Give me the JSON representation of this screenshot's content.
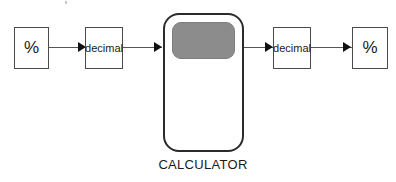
{
  "diagram": {
    "caption": "CALCULATOR",
    "colors": {
      "box_border": "#4a4a4a",
      "calculator_border": "#2b2b2b",
      "display_fill": "#8c8c8c",
      "connector": "#555555",
      "arrowhead": "#111111",
      "text": "#1a1a1a",
      "background": "#ffffff"
    },
    "nodes": [
      {
        "id": "pct-in",
        "label": "%",
        "shape": "rectangle"
      },
      {
        "id": "dec-in",
        "label": "decimal",
        "shape": "rectangle"
      },
      {
        "id": "calculator",
        "label": "CALCULATOR",
        "shape": "rounded-device"
      },
      {
        "id": "dec-out",
        "label": "decimal",
        "shape": "rectangle"
      },
      {
        "id": "pct-out",
        "label": "%",
        "shape": "rectangle"
      }
    ],
    "edges": [
      {
        "id": "edge-1",
        "from": "pct-in",
        "to": "dec-in",
        "label": ""
      },
      {
        "id": "edge-2",
        "from": "dec-in",
        "to": "calculator",
        "label": ""
      },
      {
        "id": "edge-3",
        "from": "calculator",
        "to": "dec-out",
        "label": ""
      },
      {
        "id": "edge-4",
        "from": "dec-out",
        "to": "pct-out",
        "label": ""
      }
    ]
  }
}
